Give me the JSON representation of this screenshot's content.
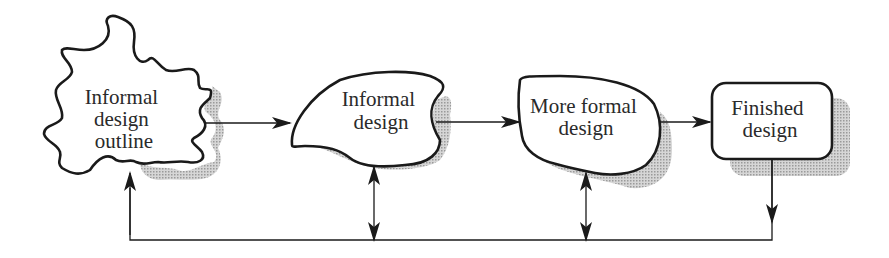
{
  "diagram": {
    "nodes": [
      {
        "id": "outline",
        "shape": "cloud",
        "lines": [
          "Informal",
          "design",
          "outline"
        ]
      },
      {
        "id": "informal",
        "shape": "blob",
        "lines": [
          "Informal",
          "design"
        ]
      },
      {
        "id": "more_formal",
        "shape": "rounded-blob",
        "lines": [
          "More formal",
          "design"
        ]
      },
      {
        "id": "finished",
        "shape": "rounded-rectangle",
        "lines": [
          "Finished",
          "design"
        ]
      }
    ],
    "edges": [
      {
        "from": "outline",
        "to": "informal",
        "type": "forward-arrow"
      },
      {
        "from": "informal",
        "to": "more_formal",
        "type": "forward-arrow"
      },
      {
        "from": "more_formal",
        "to": "finished",
        "type": "forward-arrow"
      },
      {
        "from": "informal",
        "to": "feedback_line",
        "type": "bidirectional-arrow"
      },
      {
        "from": "more_formal",
        "to": "feedback_line",
        "type": "bidirectional-arrow"
      },
      {
        "from": "finished",
        "to": "feedback_line",
        "type": "down-arrow"
      },
      {
        "from": "feedback_line",
        "to": "outline",
        "type": "up-arrow"
      }
    ],
    "colors": {
      "stroke": "#1a1a1a",
      "shadow": "#b8b8b8",
      "text": "#2a2a2a",
      "background": "#ffffff"
    }
  }
}
